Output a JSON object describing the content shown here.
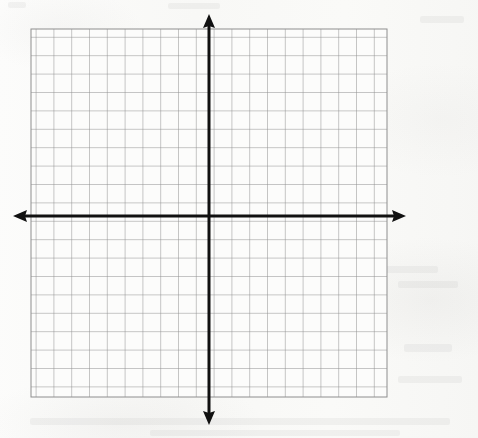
{
  "page": {
    "paper_color": "#fafaf8",
    "width": 478,
    "height": 438
  },
  "chart_data": {
    "type": "scatter",
    "title": "",
    "subtitle": "",
    "xlabel": "",
    "ylabel": "",
    "x": [],
    "y": [],
    "series": [],
    "annotations": [],
    "legend": {
      "entries": [],
      "position": "none"
    },
    "grid": {
      "visible": true,
      "columns": 20,
      "rows": 20,
      "cell_size_px": 17.8,
      "line_color": "#8e8e8e",
      "line_width_px": 1
    },
    "axes": {
      "x": {
        "visible": true,
        "color": "#111111",
        "line_width_px": 3,
        "arrow_start": true,
        "arrow_end": true,
        "range_units": [
          -10,
          10
        ],
        "tick_labels": [],
        "tick_interval": 1
      },
      "y": {
        "visible": true,
        "color": "#111111",
        "line_width_px": 3,
        "arrow_start": true,
        "arrow_end": true,
        "range_units": [
          -10,
          10
        ],
        "tick_labels": [],
        "tick_interval": 1
      }
    },
    "origin": {
      "label": "",
      "x_px": 209,
      "y_px": 216
    },
    "plot_box": {
      "left_px": 31,
      "top_px": 29,
      "right_px": 387,
      "bottom_px": 397
    }
  },
  "geometry": {
    "grid_left": 31,
    "grid_top": 29,
    "grid_right": 387,
    "grid_bottom": 397,
    "origin_x": 209,
    "origin_y": 216,
    "x_axis_arrow_left_tip": 13,
    "x_axis_arrow_right_tip": 406,
    "y_axis_arrow_top_tip": 14,
    "y_axis_arrow_bottom_tip": 425
  },
  "colors": {
    "paper": "#fafaf8",
    "grid_line": "#8e8e8e",
    "axis": "#111111",
    "ghost_text": "rgba(140,138,136,0.085)"
  }
}
